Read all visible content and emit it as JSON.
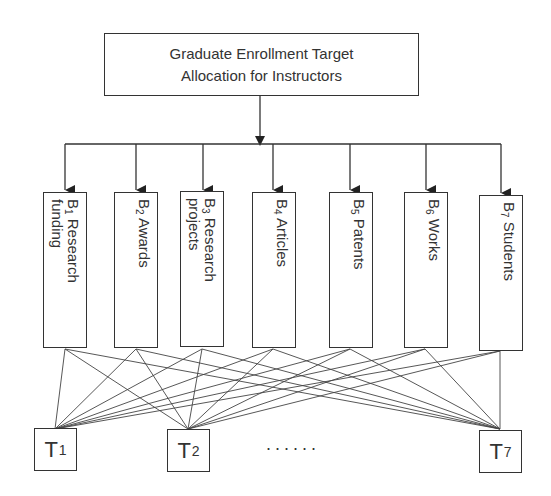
{
  "diagram": {
    "title": "Graduate Enrollment Target Allocation for Instructors",
    "root": {
      "line1": "Graduate Enrollment Target",
      "line2": "Allocation for Instructors"
    },
    "criteria": [
      {
        "letter": "B",
        "sub": "1",
        "line1": "Research",
        "line2": "funding"
      },
      {
        "letter": "B",
        "sub": "2",
        "line1": "Awards",
        "line2": ""
      },
      {
        "letter": "B",
        "sub": "3",
        "line1": "Research",
        "line2": "projects"
      },
      {
        "letter": "B",
        "sub": "4",
        "line1": "Articles",
        "line2": ""
      },
      {
        "letter": "B",
        "sub": "5",
        "line1": "Patents",
        "line2": ""
      },
      {
        "letter": "B",
        "sub": "6",
        "line1": "Works",
        "line2": ""
      },
      {
        "letter": "B",
        "sub": "7",
        "line1": "Students",
        "line2": ""
      }
    ],
    "targets": [
      {
        "letter": "T",
        "sub": "1"
      },
      {
        "letter": "T",
        "sub": "2"
      },
      {
        "letter": "T",
        "sub": "7"
      }
    ],
    "ellipsis": "......",
    "edges": "each criterion B1–B7 connects to every target T1, T2, …, T7",
    "colors": {
      "stroke": "#333333",
      "background": "#ffffff"
    }
  }
}
